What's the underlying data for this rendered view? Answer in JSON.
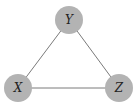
{
  "diagram": {
    "type": "undirected-graph",
    "colors": {
      "node_fill": "#b3b3b3",
      "edge": "#7a7a7a",
      "label": "#222222",
      "background": "#ffffff"
    },
    "nodes": [
      {
        "id": "Y",
        "label": "Y",
        "cx": 69,
        "cy": 20
      },
      {
        "id": "X",
        "label": "X",
        "cx": 18,
        "cy": 88
      },
      {
        "id": "Z",
        "label": "Z",
        "cx": 119,
        "cy": 88
      }
    ],
    "edges": [
      {
        "from": "X",
        "to": "Y"
      },
      {
        "from": "Y",
        "to": "Z"
      },
      {
        "from": "X",
        "to": "Z"
      }
    ]
  }
}
